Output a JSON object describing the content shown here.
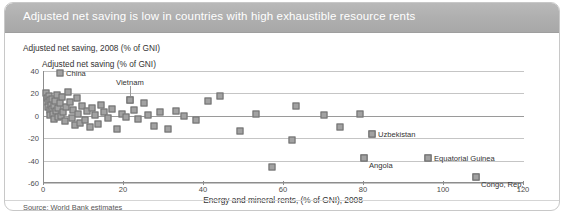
{
  "header": {
    "title": "Adjusted net saving is low in countries with high exhaustible resource rents"
  },
  "sub_title": "Adjusted net saving, 2008 (% of GNI)",
  "source": "Source: World Bank estimates",
  "colors": {
    "header_bg": "#aeaeae",
    "marker_fill": "#a2a2a2",
    "marker_border": "#6f6f6f",
    "grid": "#c5c5c5",
    "axis": "#8d8d8d"
  },
  "chart_data": {
    "type": "scatter",
    "title": "Adjusted net saving is low in countries with high exhaustible resource rents",
    "subtitle": "Adjusted net saving, 2008 (% of GNI)",
    "xlabel": "Energy and mineral rents, (% of GNI), 2008",
    "ylabel": "Adjusted net saving (% of GNI)",
    "xlim": [
      0,
      120
    ],
    "ylim": [
      -60,
      40
    ],
    "xticks": [
      0,
      20,
      40,
      60,
      80,
      100,
      120
    ],
    "yticks": [
      40,
      20,
      0,
      -20,
      -40,
      -60
    ],
    "grid": true,
    "legend": "none",
    "series": [
      {
        "name": "Countries",
        "points": [
          {
            "x": 0.6,
            "y": 20
          },
          {
            "x": 0.8,
            "y": 16
          },
          {
            "x": 1.0,
            "y": 12
          },
          {
            "x": 1.1,
            "y": 8
          },
          {
            "x": 1.2,
            "y": 18
          },
          {
            "x": 1.4,
            "y": 5
          },
          {
            "x": 1.5,
            "y": 14
          },
          {
            "x": 1.6,
            "y": 1
          },
          {
            "x": 1.8,
            "y": 10
          },
          {
            "x": 2.0,
            "y": 6
          },
          {
            "x": 2.1,
            "y": 15
          },
          {
            "x": 2.3,
            "y": 2
          },
          {
            "x": 2.5,
            "y": 9
          },
          {
            "x": 2.6,
            "y": -3
          },
          {
            "x": 2.8,
            "y": 13
          },
          {
            "x": 3.0,
            "y": 4
          },
          {
            "x": 3.2,
            "y": 19
          },
          {
            "x": 3.4,
            "y": -1
          },
          {
            "x": 3.6,
            "y": 7
          },
          {
            "x": 3.9,
            "y": 11
          },
          {
            "x": 4.2,
            "y": 0
          },
          {
            "x": 4.5,
            "y": 17
          },
          {
            "x": 4.8,
            "y": 3
          },
          {
            "x": 5.2,
            "y": -5
          },
          {
            "x": 5.6,
            "y": 8
          },
          {
            "x": 6.0,
            "y": 21
          },
          {
            "x": 6.4,
            "y": 12
          },
          {
            "x": 6.9,
            "y": -2
          },
          {
            "x": 7.3,
            "y": 5
          },
          {
            "x": 7.8,
            "y": -8
          },
          {
            "x": 8.2,
            "y": 16
          },
          {
            "x": 8.6,
            "y": 2
          },
          {
            "x": 9.0,
            "y": -6
          },
          {
            "x": 9.6,
            "y": 9
          },
          {
            "x": 10.2,
            "y": -4
          },
          {
            "x": 10.8,
            "y": 4
          },
          {
            "x": 11.4,
            "y": -10
          },
          {
            "x": 12.0,
            "y": 7
          },
          {
            "x": 12.8,
            "y": 1
          },
          {
            "x": 13.5,
            "y": -7
          },
          {
            "x": 14.2,
            "y": 10
          },
          {
            "x": 15.0,
            "y": 3
          },
          {
            "x": 16.0,
            "y": -2
          },
          {
            "x": 17.0,
            "y": 6
          },
          {
            "x": 18.2,
            "y": -12
          },
          {
            "x": 19.5,
            "y": 2
          },
          {
            "x": 20.5,
            "y": -1
          },
          {
            "x": 21.5,
            "y": 14
          },
          {
            "x": 22.5,
            "y": 5
          },
          {
            "x": 23.5,
            "y": -3
          },
          {
            "x": 25.0,
            "y": 11
          },
          {
            "x": 26.0,
            "y": 1
          },
          {
            "x": 27.5,
            "y": -9
          },
          {
            "x": 29.0,
            "y": 3
          },
          {
            "x": 31.0,
            "y": -12
          },
          {
            "x": 33.0,
            "y": 4
          },
          {
            "x": 35.0,
            "y": 0
          },
          {
            "x": 38.0,
            "y": -4
          },
          {
            "x": 41.0,
            "y": 13
          },
          {
            "x": 44.0,
            "y": 18
          },
          {
            "x": 49.0,
            "y": -14
          },
          {
            "x": 53.0,
            "y": 2
          },
          {
            "x": 57.0,
            "y": -46
          },
          {
            "x": 62.0,
            "y": -22
          },
          {
            "x": 63.0,
            "y": 9
          },
          {
            "x": 70.0,
            "y": 1
          },
          {
            "x": 74.0,
            "y": -10
          },
          {
            "x": 79.0,
            "y": 2
          },
          {
            "x": 80.0,
            "y": -38
          },
          {
            "x": 82.0,
            "y": -16
          },
          {
            "x": 96.0,
            "y": -38
          },
          {
            "x": 108.0,
            "y": -55
          }
        ]
      }
    ],
    "annotations": [
      {
        "label": "China",
        "x": 4.0,
        "y": 38
      },
      {
        "label": "Vietnam",
        "x": 21.5,
        "y": 14
      },
      {
        "label": "Uzbekistan",
        "x": 82.0,
        "y": -16
      },
      {
        "label": "Angola",
        "x": 80.0,
        "y": -38
      },
      {
        "label": "Equatorial Guinea",
        "x": 96.0,
        "y": -38
      },
      {
        "label": "Congo, Rep.",
        "x": 108.0,
        "y": -55
      }
    ],
    "source": "Source: World Bank estimates"
  }
}
